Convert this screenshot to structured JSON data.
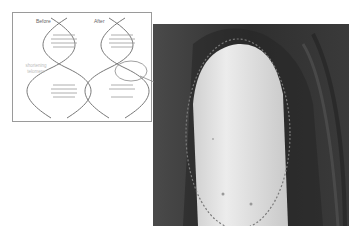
{
  "figure": {
    "inset": {
      "labels": {
        "before": "Before",
        "after": "After",
        "note": "shortening telomere"
      },
      "helices": [
        {
          "name": "before-helix",
          "state": "intact"
        },
        {
          "name": "after-helix",
          "state": "damaged/shortened"
        }
      ]
    },
    "photo": {
      "subject": "fingertip with dashed outline",
      "outline_style": "dashed"
    },
    "colors": {
      "photo_background": "#3d3d3d",
      "finger": "#e6e6e6",
      "outline": "#7a7a7a",
      "inset_border": "#9a9a9a"
    }
  }
}
